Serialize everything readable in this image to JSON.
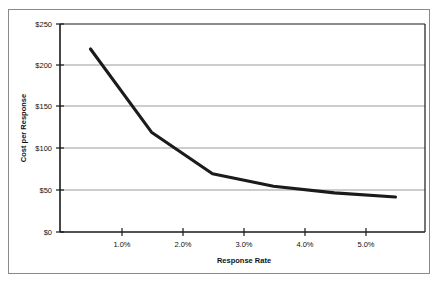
{
  "chart_data": {
    "type": "line",
    "title": "",
    "xlabel": "Response Rate",
    "ylabel": "Cost per Response",
    "x": [
      0.5,
      1.5,
      2.5,
      3.5,
      4.5,
      5.5
    ],
    "values": [
      220,
      120,
      70,
      55,
      47,
      42
    ],
    "series": [
      {
        "name": "Cost per Response",
        "values": [
          220,
          120,
          70,
          55,
          47,
          42
        ]
      }
    ],
    "xlim": [
      0,
      6.0
    ],
    "ylim": [
      0,
      250
    ],
    "x_tick_values": [
      1.0,
      2.0,
      3.0,
      4.0,
      5.0
    ],
    "x_tick_labels": [
      "1.0%",
      "2.0%",
      "3.0%",
      "4.0%",
      "5.0%"
    ],
    "y_tick_values": [
      0,
      50,
      100,
      150,
      200,
      250
    ],
    "y_tick_labels": [
      "$0",
      "$50",
      "$100",
      "$150",
      "$200",
      "$250"
    ],
    "grid": "horizontal",
    "legend": "none",
    "line_color": "#1b1b1b",
    "grid_color": "#9b9b9b",
    "axis_color": "#1a1a1a"
  },
  "axes": {
    "x_title": "Response Rate",
    "y_title": "Cost per Response",
    "x_ticks": [
      {
        "label": "1.0%"
      },
      {
        "label": "2.0%"
      },
      {
        "label": "3.0%"
      },
      {
        "label": "4.0%"
      },
      {
        "label": "5.0%"
      }
    ],
    "y_ticks": [
      {
        "label": "$250"
      },
      {
        "label": "$200"
      },
      {
        "label": "$150"
      },
      {
        "label": "$100"
      },
      {
        "label": "$50"
      },
      {
        "label": "$0"
      }
    ]
  }
}
